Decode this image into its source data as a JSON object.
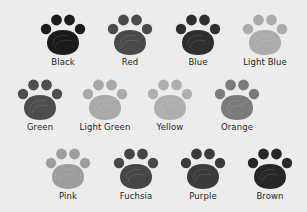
{
  "title": "Paw color options",
  "rows": [
    [
      {
        "label": "Black",
        "color": "#1b1b1b"
      },
      {
        "label": "Red",
        "color": "#4a4a4a"
      },
      {
        "label": "Blue",
        "color": "#2f2f2f"
      },
      {
        "label": "Light Blue",
        "color": "#ababab"
      }
    ],
    [
      {
        "label": "Green",
        "color": "#4d4d4d"
      },
      {
        "label": "Light Green",
        "color": "#a9a9a9"
      },
      {
        "label": "Yellow",
        "color": "#afafaf"
      },
      {
        "label": "Orange",
        "color": "#7b7b7b"
      }
    ],
    [
      {
        "label": "Pink",
        "color": "#9d9d9d"
      },
      {
        "label": "Fuchsia",
        "color": "#464646"
      },
      {
        "label": "Purple",
        "color": "#3b3b3b"
      },
      {
        "label": "Brown",
        "color": "#272727"
      }
    ]
  ]
}
